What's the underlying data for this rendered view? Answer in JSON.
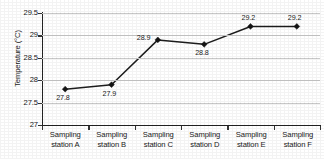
{
  "chart_data": {
    "type": "line",
    "title": "",
    "xlabel": "",
    "ylabel": "Temperature (°C)",
    "categories": [
      "Sampling station A",
      "Sampling station B",
      "Sampling station C",
      "Sampling station D",
      "Sampling station E",
      "Sampling station F"
    ],
    "category_lines": [
      {
        "line1": "Sampling",
        "line2": "station A"
      },
      {
        "line1": "Sampling",
        "line2": "station B"
      },
      {
        "line1": "Sampling",
        "line2": "station C"
      },
      {
        "line1": "Sampling",
        "line2": "station D"
      },
      {
        "line1": "Sampling",
        "line2": "station E"
      },
      {
        "line1": "Sampling",
        "line2": "station F"
      }
    ],
    "values": [
      27.8,
      27.9,
      28.9,
      28.8,
      29.2,
      29.2
    ],
    "point_labels": [
      "27.8",
      "27.9",
      "28.9",
      "28.8",
      "29.2",
      "29.2"
    ],
    "label_positions": [
      "below",
      "below",
      "left-above",
      "below",
      "above",
      "above"
    ],
    "ylim": [
      27,
      29.5
    ],
    "ytick_values": [
      29.5,
      29,
      28.5,
      28,
      27.5,
      27
    ],
    "ytick_labels": [
      "29.5",
      "29",
      "28.5",
      "28",
      "27.5",
      "27"
    ],
    "grid": "horizontal",
    "legend": "none",
    "series_color": "#1d1d1d",
    "gridline_color": "#c9c9c9",
    "axis_color": "#222222",
    "background_color": "#ffffff",
    "marker": "diamond"
  }
}
